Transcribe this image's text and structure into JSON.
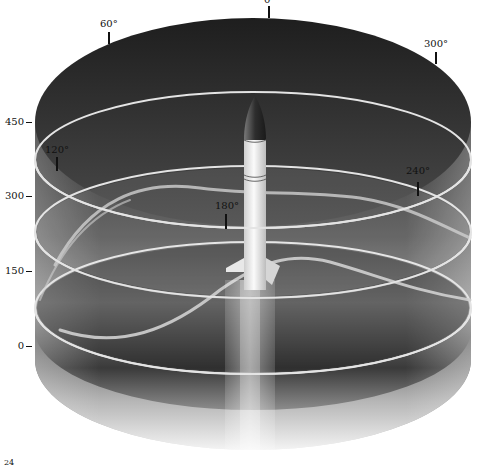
{
  "diagram": {
    "type": "3d-cylinder-altitude-azimuth",
    "altitude_axis": {
      "ticks": [
        {
          "label": "450",
          "y": 122
        },
        {
          "label": "300",
          "y": 196
        },
        {
          "label": "150",
          "y": 271
        },
        {
          "label": "0",
          "y": 346
        }
      ]
    },
    "azimuth_markers": [
      {
        "label": "0°",
        "x": 270,
        "y": -4,
        "tick_x": 269,
        "tick_y1": 8,
        "tick_y2": 18
      },
      {
        "label": "60°",
        "x": 101,
        "y": 20,
        "tick_x": 109,
        "tick_y1": 32,
        "tick_y2": 44
      },
      {
        "label": "300°",
        "x": 425,
        "y": 40,
        "tick_x": 436,
        "tick_y1": 52,
        "tick_y2": 64
      },
      {
        "label": "120°",
        "x": 46,
        "y": 146,
        "tick_x": 57,
        "tick_y1": 157,
        "tick_y2": 171
      },
      {
        "label": "240°",
        "x": 407,
        "y": 166,
        "tick_x": 418,
        "tick_y1": 182,
        "tick_y2": 196
      },
      {
        "label": "180°",
        "x": 216,
        "y": 201,
        "tick_x": 226,
        "tick_y1": 214,
        "tick_y2": 229
      }
    ],
    "corner_fragment": "24",
    "colors": {
      "cylinder_dark": "#2a2a2a",
      "cylinder_mid": "#6a6a6a",
      "cylinder_light": "#d8d8d8",
      "ring": "#e6e6e6",
      "rocket_body": "#efefef",
      "rocket_nose": "#3a3a3a",
      "label": "#111111"
    }
  }
}
